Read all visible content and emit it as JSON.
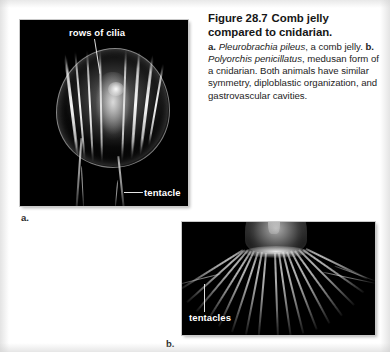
{
  "figure": {
    "number": "Figure 28.7",
    "title": "Comb jelly compared to cnidarian.",
    "caption_parts": {
      "a_marker": "a.",
      "a_species": "Pleurobrachia pileus",
      "a_text": ", a comb jelly. ",
      "b_marker": "b.",
      "b_species": "Polyorchis penicillatus",
      "b_text": ", medusan form of a cnidarian. Both animals have similar symmetry, diploblastic organization, and gastrovascular cavities."
    },
    "caption_full": "a. Pleurobrachia pileus, a comb jelly. b. Polyorchis penicillatus, medusan form of a cnidarian. Both animals have similar symmetry, diploblastic organization, and gastrovascular cavities."
  },
  "panels": {
    "a": {
      "letter": "a.",
      "subject": "comb jelly (ctenophore) photograph",
      "labels": {
        "rows_of_cilia": "rows of cilia",
        "tentacle": "tentacle"
      }
    },
    "b": {
      "letter": "b.",
      "subject": "medusa jellyfish photograph",
      "labels": {
        "tentacles": "tentacles"
      }
    }
  },
  "colors": {
    "page_background": "#ffffff",
    "photo_background": "#000000",
    "label_text": "#ffffff",
    "caption_title": "#161616",
    "caption_body": "#1d1d1d"
  }
}
